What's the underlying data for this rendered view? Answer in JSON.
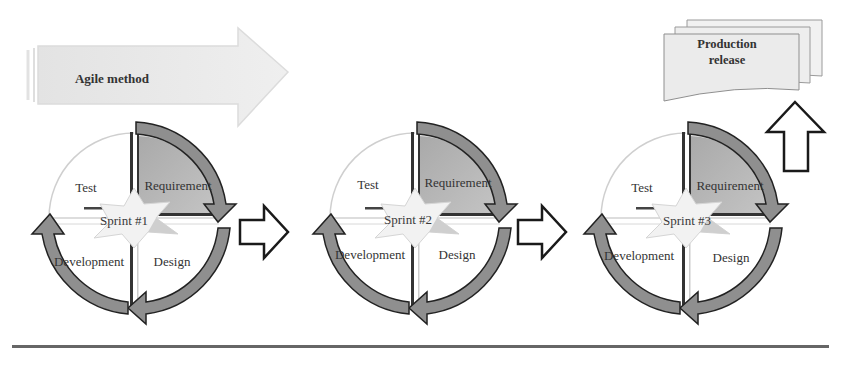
{
  "header_arrow": {
    "label": "Agile method"
  },
  "production": {
    "label_line1": "Production",
    "label_line2": "release"
  },
  "sprints": [
    {
      "name": "Sprint #1",
      "quadrants": {
        "test": "Test",
        "requirement": "Requirement",
        "development": "Development",
        "design": "Design"
      }
    },
    {
      "name": "Sprint #2",
      "quadrants": {
        "test": "Test",
        "requirement": "Requirement",
        "development": "Development",
        "design": "Design"
      }
    },
    {
      "name": "Sprint #3",
      "quadrants": {
        "test": "Test",
        "requirement": "Requirement",
        "development": "Development",
        "design": "Design"
      }
    }
  ],
  "colors": {
    "requirement_fill": "#b5b5b5",
    "cycle_arrow": "#8f8f8f",
    "agile_arrow": "#e9e9e9",
    "stroke": "#222222",
    "baseline": "#555555"
  }
}
